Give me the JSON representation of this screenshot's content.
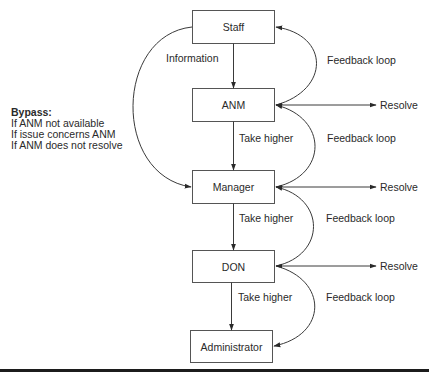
{
  "diagram": {
    "nodes": [
      {
        "id": "staff",
        "label": "Staff"
      },
      {
        "id": "anm",
        "label": "ANM"
      },
      {
        "id": "manager",
        "label": "Manager"
      },
      {
        "id": "don",
        "label": "DON"
      },
      {
        "id": "administrator",
        "label": "Administrator"
      }
    ],
    "edges": {
      "information": "Information",
      "take_higher_1": "Take higher",
      "take_higher_2": "Take higher",
      "take_higher_3": "Take higher",
      "feedback_1": "Feedback loop",
      "feedback_2": "Feedback loop",
      "feedback_3": "Feedback loop",
      "feedback_4": "Feedback loop",
      "resolve_1": "Resolve",
      "resolve_2": "Resolve",
      "resolve_3": "Resolve"
    },
    "bypass": {
      "title": "Bypass:",
      "conditions": [
        "If ANM not available",
        "If issue concerns ANM",
        "If ANM does not resolve"
      ]
    }
  },
  "colors": {
    "line": "#3a3a3a",
    "box_border": "#555555",
    "text": "#2a2a2a",
    "bottom_bar": "#1c1c1c"
  }
}
